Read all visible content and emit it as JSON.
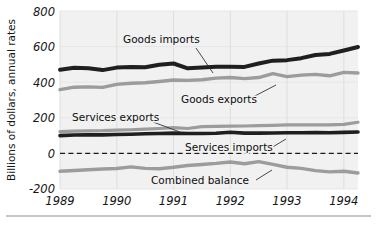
{
  "chart_data": {
    "type": "line",
    "title": "",
    "subtitle": "",
    "xlabel": "",
    "ylabel": "Billions of dollars, annual rates",
    "xlim": [
      1989.0,
      1994.25
    ],
    "ylim": [
      -200,
      800
    ],
    "yticks": [
      -200,
      0,
      200,
      400,
      600,
      800
    ],
    "ytick_labels": [
      "-200",
      "0",
      "200",
      "400",
      "600",
      "800"
    ],
    "xticks": [
      1989,
      1990,
      1991,
      1992,
      1993,
      1994
    ],
    "xtick_labels": [
      "1989",
      "1990",
      "1991",
      "1992",
      "1993",
      "1994"
    ],
    "grid": "faint vertical gridlines at each year, faint horizontal gridlines at each y tick",
    "legend_position": "inline annotations with leader lines",
    "zero_reference_line": {
      "value": 0,
      "style": "dashed"
    },
    "x": [
      1989.0,
      1989.25,
      1989.5,
      1989.75,
      1990.0,
      1990.25,
      1990.5,
      1990.75,
      1991.0,
      1991.25,
      1991.5,
      1991.75,
      1992.0,
      1992.25,
      1992.5,
      1992.75,
      1993.0,
      1993.25,
      1993.5,
      1993.75,
      1994.0,
      1994.25
    ],
    "series": [
      {
        "name": "Goods imports",
        "color": "#1f1f1f",
        "values": [
          470,
          481,
          478,
          468,
          482,
          486,
          484,
          498,
          505,
          478,
          482,
          487,
          487,
          486,
          505,
          521,
          524,
          535,
          553,
          559,
          578,
          598
        ]
      },
      {
        "name": "Goods exports",
        "color": "#9c9c9c",
        "values": [
          358,
          372,
          374,
          371,
          388,
          394,
          397,
          404,
          412,
          410,
          414,
          423,
          426,
          420,
          426,
          448,
          431,
          440,
          444,
          436,
          455,
          452
        ]
      },
      {
        "name": "Services exports",
        "color": "#9c9c9c",
        "values": [
          122,
          125,
          127,
          128,
          131,
          133,
          136,
          140,
          145,
          140,
          150,
          152,
          153,
          154,
          156,
          158,
          160,
          160,
          161,
          160,
          163,
          175
        ]
      },
      {
        "name": "Services imports",
        "color": "#1f1f1f",
        "values": [
          100,
          103,
          104,
          104,
          106,
          108,
          110,
          112,
          114,
          112,
          112,
          113,
          119,
          114,
          114,
          115,
          116,
          116,
          117,
          116,
          118,
          120
        ]
      },
      {
        "name": "Combined balance",
        "color": "#9c9c9c",
        "values": [
          -100,
          -96,
          -92,
          -88,
          -85,
          -76,
          -84,
          -86,
          -78,
          -68,
          -62,
          -56,
          -48,
          -58,
          -46,
          -62,
          -78,
          -84,
          -97,
          -104,
          -100,
          -110
        ]
      }
    ],
    "annotations": [
      {
        "text": "Goods imports",
        "target_series": "Goods imports"
      },
      {
        "text": "Goods exports",
        "target_series": "Goods exports"
      },
      {
        "text": "Services exports",
        "target_series": "Services exports"
      },
      {
        "text": "Services imports",
        "target_series": "Services imports"
      },
      {
        "text": "Combined balance",
        "target_series": "Combined balance"
      }
    ]
  },
  "axis": {
    "y_title": "Billions of dollars, annual rates",
    "y_labels": {
      "t800": "800",
      "t600": "600",
      "t400": "400",
      "t200": "200",
      "t0": "0",
      "tm200": "-200"
    },
    "x_labels": {
      "y1989": "1989",
      "y1990": "1990",
      "y1991": "1991",
      "y1992": "1992",
      "y1993": "1993",
      "y1994": "1994"
    }
  },
  "labels": {
    "goods_imports": "Goods imports",
    "goods_exports": "Goods exports",
    "services_exports": "Services exports",
    "services_imports": "Services imports",
    "combined_balance": "Combined balance"
  },
  "colors": {
    "dark_series": "#1f1f1f",
    "light_series": "#9c9c9c",
    "plot_background": "#f1f1f1",
    "page_background": "#ffffff",
    "text": "#161616"
  }
}
